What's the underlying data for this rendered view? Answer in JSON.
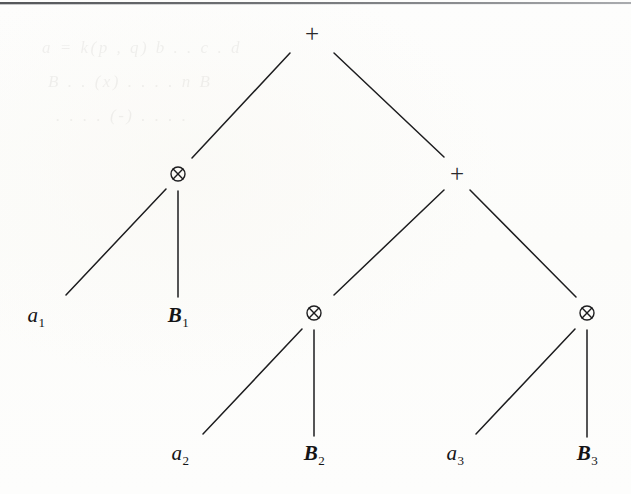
{
  "figure": {
    "kind": "expression-tree",
    "width": 631,
    "height": 494,
    "background_color": "#fdfdfc",
    "ink_color": "#1d1d1f",
    "rule_color": "#55575a"
  },
  "tree": {
    "nodes": [
      {
        "id": "root",
        "symbol": "+",
        "icon": "plus-operator-icon",
        "x": 312,
        "y": 33,
        "level": 0
      },
      {
        "id": "n-l",
        "symbol": "⊗",
        "icon": "tensor-operator-icon",
        "x": 178,
        "y": 174,
        "level": 1
      },
      {
        "id": "n-r",
        "symbol": "+",
        "icon": "plus-operator-icon",
        "x": 457,
        "y": 173,
        "level": 1
      },
      {
        "id": "n-rl",
        "symbol": "⊗",
        "icon": "tensor-operator-icon",
        "x": 314,
        "y": 313,
        "level": 2
      },
      {
        "id": "n-rr",
        "symbol": "⊗",
        "icon": "tensor-operator-icon",
        "x": 587,
        "y": 313,
        "level": 2
      }
    ],
    "leaves": [
      {
        "id": "leaf-a1",
        "base": "a",
        "subscript": "1",
        "text": "a1",
        "bold": false,
        "x": 36,
        "y": 315
      },
      {
        "id": "leaf-B1",
        "base": "B",
        "subscript": "1",
        "text": "B1",
        "bold": true,
        "x": 178,
        "y": 315
      },
      {
        "id": "leaf-a2",
        "base": "a",
        "subscript": "2",
        "text": "a2",
        "bold": false,
        "x": 180,
        "y": 453
      },
      {
        "id": "leaf-B2",
        "base": "B",
        "subscript": "2",
        "text": "B2",
        "bold": true,
        "x": 314,
        "y": 453
      },
      {
        "id": "leaf-a3",
        "base": "a",
        "subscript": "3",
        "text": "a3",
        "bold": false,
        "x": 455,
        "y": 453
      },
      {
        "id": "leaf-B3",
        "base": "B",
        "subscript": "3",
        "text": "B3",
        "bold": true,
        "x": 587,
        "y": 453
      }
    ],
    "edges": [
      {
        "id": "e-root-l",
        "from": "root",
        "to": "n-l",
        "x1": 290,
        "y1": 53,
        "x2": 192,
        "y2": 158
      },
      {
        "id": "e-root-r",
        "from": "root",
        "to": "n-r",
        "x1": 334,
        "y1": 53,
        "x2": 444,
        "y2": 157
      },
      {
        "id": "e-l-a1",
        "from": "n-l",
        "to": "leaf-a1",
        "x1": 166,
        "y1": 189,
        "x2": 66,
        "y2": 295
      },
      {
        "id": "e-l-B1",
        "from": "n-l",
        "to": "leaf-B1",
        "x1": 178,
        "y1": 191,
        "x2": 178,
        "y2": 297
      },
      {
        "id": "e-r-rl",
        "from": "n-r",
        "to": "n-rl",
        "x1": 444,
        "y1": 190,
        "x2": 334,
        "y2": 295
      },
      {
        "id": "e-r-rr",
        "from": "n-r",
        "to": "n-rr",
        "x1": 470,
        "y1": 190,
        "x2": 576,
        "y2": 297
      },
      {
        "id": "e-rl-a2",
        "from": "n-rl",
        "to": "leaf-a2",
        "x1": 302,
        "y1": 329,
        "x2": 203,
        "y2": 434
      },
      {
        "id": "e-rl-B2",
        "from": "n-rl",
        "to": "leaf-B2",
        "x1": 314,
        "y1": 330,
        "x2": 314,
        "y2": 436
      },
      {
        "id": "e-rr-a3",
        "from": "n-rr",
        "to": "leaf-a3",
        "x1": 575,
        "y1": 329,
        "x2": 476,
        "y2": 434
      },
      {
        "id": "e-rr-B3",
        "from": "n-rr",
        "to": "leaf-B3",
        "x1": 587,
        "y1": 330,
        "x2": 587,
        "y2": 437
      }
    ]
  },
  "bleed_through": {
    "visible": true,
    "opacity": 0.085,
    "lines": [
      {
        "text": "a   =  k(p   ,  q)  b   .  .  c  .  d",
        "x": 42,
        "y": 38,
        "size": 17
      },
      {
        "text": "B      .  .  (x)   .  .   .  .   n  B",
        "x": 48,
        "y": 72,
        "size": 17
      },
      {
        "text": ".  .   .   .   (-)   .   .    .   .",
        "x": 56,
        "y": 106,
        "size": 17
      }
    ]
  }
}
